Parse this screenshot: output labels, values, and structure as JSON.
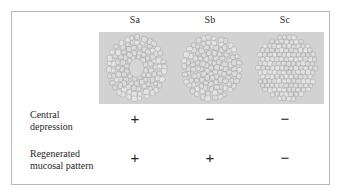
{
  "figure": {
    "columns": [
      {
        "id": "sa",
        "label": "Sa"
      },
      {
        "id": "sb",
        "label": "Sb"
      },
      {
        "id": "sc",
        "label": "Sc"
      }
    ],
    "illustration": {
      "background_color": "#d2d2d2",
      "cell_fill_color": "#dcdcdc",
      "cell_stroke_color": "#9a9a9a",
      "panels": [
        {
          "id": "sa",
          "column": "Sa",
          "description": "cell cluster with central depression",
          "has_central_void": true
        },
        {
          "id": "sb",
          "column": "Sb",
          "description": "cell cluster with regenerated mucosal pattern, no central depression",
          "has_central_void": false
        },
        {
          "id": "sc",
          "column": "Sc",
          "description": "uniform cell cluster, no depression and no regenerated pattern",
          "has_central_void": false
        }
      ]
    },
    "rows": [
      {
        "id": "central-depression",
        "label_lines": [
          "Central",
          "depression"
        ],
        "values": {
          "sa": "+",
          "sb": "−",
          "sc": "−"
        }
      },
      {
        "id": "regenerated-mucosal-pattern",
        "label_lines": [
          "Regenerated",
          "mucosal pattern"
        ],
        "values": {
          "sa": "+",
          "sb": "+",
          "sc": "−"
        }
      }
    ],
    "colors": {
      "frame_border": "#b9b9b9",
      "page_background": "#ffffff",
      "text": "#1f1f1f"
    }
  }
}
